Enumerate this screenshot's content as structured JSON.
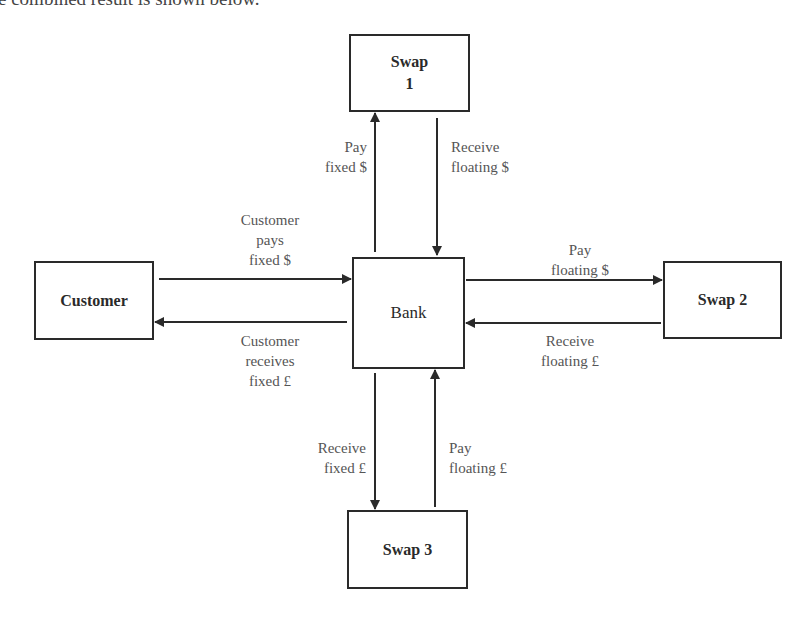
{
  "caption_clipped": "e combined result is shown below.",
  "nodes": {
    "swap1": "Swap\n1",
    "customer": "Customer",
    "bank": "Bank",
    "swap2": "Swap 2",
    "swap3": "Swap 3"
  },
  "edges": {
    "bank_to_swap1": "Pay\nfixed $",
    "swap1_to_bank": "Receive\nfloating $",
    "customer_to_bank": "Customer\npays\nfixed $",
    "bank_to_customer": "Customer\nreceives\nfixed £",
    "bank_to_swap2": "Pay\nfloating $",
    "swap2_to_bank": "Receive\nfloating £",
    "bank_to_swap3": "Receive\nfixed £",
    "swap3_to_bank": "Pay\nfloating £"
  },
  "colors": {
    "line": "#2a2a2a",
    "label": "#555555"
  }
}
